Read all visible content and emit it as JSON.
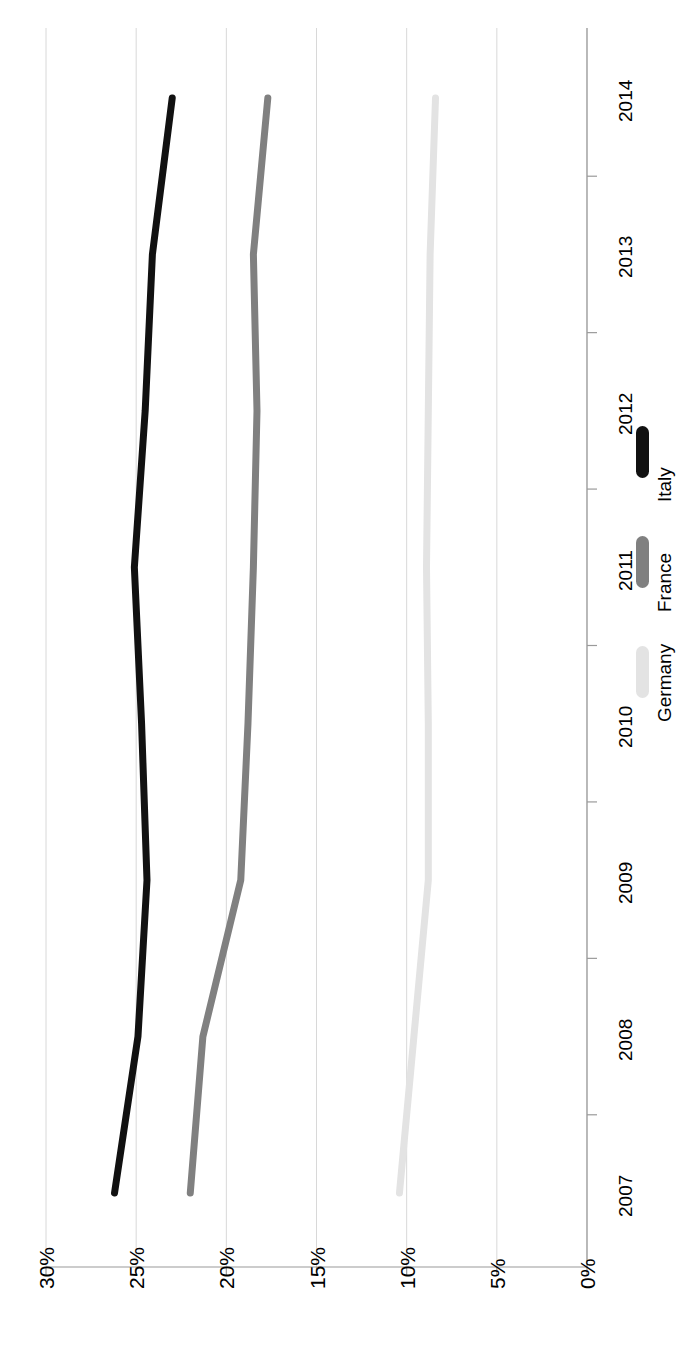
{
  "chart_data": {
    "type": "line",
    "title": "",
    "subtitle": "",
    "xlabel": "",
    "ylabel": "",
    "orientation": "rotated-90",
    "grid": true,
    "legend_position": "right-middle",
    "categories": [
      "2007",
      "2008",
      "2009",
      "2010",
      "2011",
      "2012",
      "2013",
      "2014"
    ],
    "x": [
      "2007",
      "2008",
      "2009",
      "2010",
      "2011",
      "2012",
      "2013",
      "2014"
    ],
    "value_axis_ticks": [
      "0%",
      "5%",
      "10%",
      "15%",
      "20%",
      "25%",
      "30%"
    ],
    "ylim": [
      0,
      30
    ],
    "value_unit": "%",
    "series": [
      {
        "name": "Germany",
        "color": "#e3e3e3",
        "values": [
          10.4,
          9.6,
          8.8,
          8.8,
          8.9,
          8.8,
          8.7,
          8.4
        ]
      },
      {
        "name": "France",
        "color": "#808080",
        "values": [
          22.0,
          21.3,
          19.2,
          18.8,
          18.5,
          18.3,
          18.5,
          17.7
        ]
      },
      {
        "name": "Italy",
        "color": "#111111",
        "values": [
          26.2,
          24.9,
          24.4,
          24.7,
          25.1,
          24.5,
          24.1,
          23.0
        ]
      }
    ]
  },
  "legend": {
    "entries": [
      {
        "label": "Germany",
        "color": "#e3e3e3"
      },
      {
        "label": "France",
        "color": "#808080"
      },
      {
        "label": "Italy",
        "color": "#111111"
      }
    ]
  },
  "axes": {
    "value_axis": {
      "labels": [
        "30%",
        "25%",
        "20%",
        "15%",
        "10%",
        "5%",
        "0%"
      ]
    },
    "category_axis": {
      "labels": [
        "2014",
        "2013",
        "2012",
        "2011",
        "2010",
        "2009",
        "2008",
        "2007"
      ]
    }
  },
  "colors": {
    "gridline": "#d8d8d8",
    "axis": "#9a9a9a",
    "background": "#ffffff",
    "text": "#000000"
  }
}
